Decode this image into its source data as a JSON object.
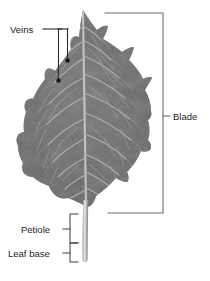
{
  "figure": {
    "subject": "leaf",
    "background_color": "#ffffff",
    "width": 210,
    "height": 281
  },
  "labels": {
    "veins": "Veins",
    "blade": "Blade",
    "petiole": "Petiole",
    "leaf_base": "Leaf base"
  },
  "annotations": [
    {
      "id": "veins",
      "label": "Veins",
      "label_x": 10,
      "label_y": 32,
      "leader": "horizontal-bar-two-drops",
      "marker": "dot",
      "color": "#1b1b1b"
    },
    {
      "id": "blade",
      "label": "Blade",
      "label_x": 175,
      "label_y": 117,
      "leader": "right-square-bracket",
      "marker": "tick",
      "color": "#6d6d6d"
    },
    {
      "id": "petiole",
      "label": "Petiole",
      "label_x": 22,
      "label_y": 235,
      "leader": "left-square-bracket",
      "marker": "tick",
      "color": "#3a3a3a"
    },
    {
      "id": "leaf-base",
      "label": "Leaf base",
      "label_x": 8,
      "label_y": 257,
      "leader": "left-square-bracket",
      "marker": "tick",
      "color": "#3a3a3a"
    }
  ],
  "colors": {
    "leaf_dark": "#5e5e5e",
    "leaf_mid": "#6d6d6d",
    "leaf_light": "#8a8a8a",
    "vein_color": "#b4b4b4",
    "midrib_color": "#c9c9c9",
    "petiole_color": "#bdbdbd",
    "line_color": "#2b2b2b",
    "bracket_gray": "#6d6d6d",
    "text_color": "#1b1b1b",
    "background": "#ffffff"
  },
  "geometry": {
    "leaf_tip": [
      83,
      10
    ],
    "leaf_base_point": [
      86,
      207
    ],
    "leaf_left_extent": 18,
    "leaf_right_extent": 152,
    "petiole_top": 205,
    "petiole_bottom": 262,
    "blade_bracket_top_y": 13,
    "blade_bracket_bottom_y": 213,
    "blade_bracket_x": 163,
    "petiole_bracket_x": 70,
    "petiole_bracket_top_y": 214,
    "petiole_bracket_mid_y": 243,
    "petiole_bracket_bottom_y": 262
  }
}
